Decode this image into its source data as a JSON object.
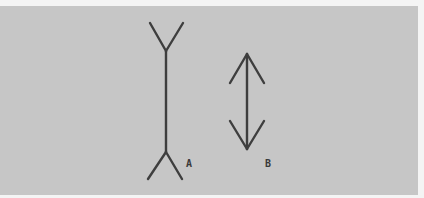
{
  "figure": {
    "caption_partial": "",
    "panel_color": "#c6c6c6",
    "stroke_color": "#3e3e3e",
    "labels": {
      "a": "A",
      "b": "B"
    },
    "items": [
      {
        "id": "A",
        "description": "Vertical line with outward-pointing fins (tails) at both ends"
      },
      {
        "id": "B",
        "description": "Vertical line with inward-pointing arrowheads at both ends"
      }
    ]
  }
}
